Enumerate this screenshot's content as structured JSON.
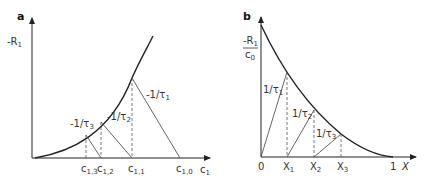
{
  "panels": {
    "a": {
      "label": "a",
      "y_axis": {
        "label": "-R",
        "sub": "1"
      },
      "x_axis": {
        "label": "c",
        "sub": "1"
      },
      "slopes": [
        {
          "text": "-1/τ",
          "sub": "1"
        },
        {
          "text": "-1/τ",
          "sub": "2"
        },
        {
          "text": "-1/τ",
          "sub": "3"
        }
      ],
      "ticks": [
        {
          "text": "c",
          "sub": "1,3"
        },
        {
          "text": "c",
          "sub": "1,2"
        },
        {
          "text": "c",
          "sub": "1,1"
        },
        {
          "text": "c",
          "sub": "1,0"
        }
      ]
    },
    "b": {
      "label": "b",
      "y_axis": {
        "num": "-R",
        "num_sub": "1",
        "den": "c",
        "den_sub": "0"
      },
      "x_axis": {
        "label": "X"
      },
      "origin": "0",
      "end": "1",
      "slopes": [
        {
          "text": "1/τ",
          "sub": "1"
        },
        {
          "text": "1/τ",
          "sub": "2"
        },
        {
          "text": "1/τ",
          "sub": "3"
        }
      ],
      "ticks": [
        {
          "text": "X",
          "sub": "1"
        },
        {
          "text": "X",
          "sub": "2"
        },
        {
          "text": "X",
          "sub": "3"
        }
      ]
    }
  }
}
